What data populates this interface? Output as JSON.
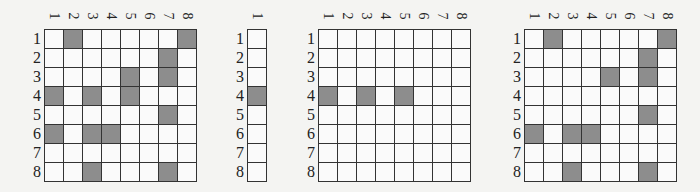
{
  "colors": {
    "filled": "#8d8d8d",
    "empty": "#fafafa",
    "border": "#333333"
  },
  "grids": [
    {
      "id": "grid-a",
      "x": 44,
      "y": 29,
      "rows": 8,
      "cols": 8,
      "col_labels": [
        "1",
        "2",
        "3",
        "4",
        "5",
        "6",
        "7",
        "8"
      ],
      "row_labels": [
        "1",
        "2",
        "3",
        "4",
        "5",
        "6",
        "7",
        "8"
      ],
      "filled": [
        [
          1,
          2
        ],
        [
          1,
          8
        ],
        [
          2,
          7
        ],
        [
          3,
          5
        ],
        [
          3,
          7
        ],
        [
          4,
          1
        ],
        [
          4,
          3
        ],
        [
          4,
          5
        ],
        [
          5,
          7
        ],
        [
          6,
          1
        ],
        [
          6,
          3
        ],
        [
          6,
          4
        ],
        [
          8,
          3
        ],
        [
          8,
          7
        ]
      ]
    },
    {
      "id": "grid-b",
      "x": 247,
      "y": 29,
      "rows": 8,
      "cols": 1,
      "col_labels": [
        "1"
      ],
      "row_labels": [
        "1",
        "2",
        "3",
        "4",
        "5",
        "6",
        "7",
        "8"
      ],
      "filled": [
        [
          4,
          1
        ]
      ]
    },
    {
      "id": "grid-c",
      "x": 318,
      "y": 29,
      "rows": 8,
      "cols": 8,
      "col_labels": [
        "1",
        "2",
        "3",
        "4",
        "5",
        "6",
        "7",
        "8"
      ],
      "row_labels": [
        "1",
        "2",
        "3",
        "4",
        "5",
        "6",
        "7",
        "8"
      ],
      "filled": [
        [
          4,
          1
        ],
        [
          4,
          3
        ],
        [
          4,
          5
        ]
      ]
    },
    {
      "id": "grid-d",
      "x": 524,
      "y": 29,
      "rows": 8,
      "cols": 8,
      "col_labels": [
        "1",
        "2",
        "3",
        "4",
        "5",
        "6",
        "7",
        "8"
      ],
      "row_labels": [
        "1",
        "2",
        "3",
        "4",
        "5",
        "6",
        "7",
        "8"
      ],
      "filled": [
        [
          1,
          2
        ],
        [
          1,
          8
        ],
        [
          2,
          7
        ],
        [
          3,
          5
        ],
        [
          3,
          7
        ],
        [
          5,
          7
        ],
        [
          6,
          1
        ],
        [
          6,
          3
        ],
        [
          6,
          4
        ],
        [
          8,
          3
        ],
        [
          8,
          7
        ]
      ]
    }
  ]
}
